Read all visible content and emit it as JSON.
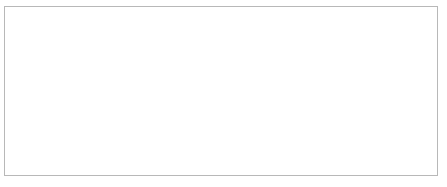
{
  "chart_data": {
    "type": "line",
    "title": "",
    "xlabel": "Cohort",
    "ylabel": "",
    "categories": [
      "1940",
      "1950",
      "1960",
      "1970",
      "1980",
      "1990",
      "2000"
    ],
    "x": [
      1940,
      1950,
      1960,
      1970,
      1980,
      1990,
      2000
    ],
    "ylim": [
      0,
      35
    ],
    "yticks": [
      0,
      5,
      10,
      15,
      20,
      25,
      30,
      35
    ],
    "ytick_labels": [
      "0",
      "5",
      "10",
      "15",
      "20",
      "25",
      "30",
      "35"
    ],
    "grid": "horizontal",
    "legend_position": "right",
    "series": [
      {
        "name": "White males",
        "marker": "triangle",
        "line_style": "solid",
        "color": "#000000",
        "values": [
          1.8,
          3.2,
          5.0,
          6.8,
          12.8,
          13.5,
          29.2
        ]
      },
      {
        "name": "Black males",
        "marker": "none",
        "line_style": "dashed",
        "color": "#000000",
        "values": [
          1.5,
          2.6,
          3.9,
          6.2,
          11.2,
          12.0,
          12.8
        ]
      },
      {
        "name": "White females",
        "marker": "none",
        "line_style": "solid",
        "color": "#000000",
        "values": [
          5.3,
          6.0,
          8.3,
          13.4,
          22.4,
          23.7,
          33.5
        ]
      },
      {
        "name": "Black females",
        "marker": "square",
        "line_style": "solid",
        "color": "#000000",
        "values": [
          8.0,
          10.4,
          16.6,
          20.9,
          26.7,
          23.5,
          17.9
        ]
      }
    ]
  },
  "axis": {
    "x_title": "Cohort"
  },
  "legend": {
    "entries": [
      {
        "label": "White males"
      },
      {
        "label": "Black males"
      },
      {
        "label": "White females"
      },
      {
        "label": "Black females"
      }
    ]
  },
  "colors": {
    "ink": "#000000",
    "grid": "#c9c9c9",
    "axis": "#7a7a7a",
    "border": "#b8b8b8",
    "background": "#ffffff"
  }
}
